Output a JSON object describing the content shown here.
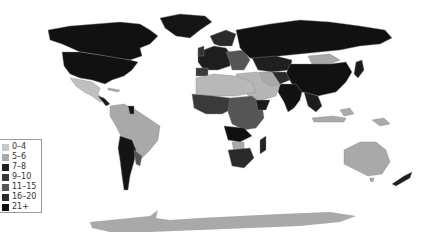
{
  "map": {
    "title": "",
    "projection": "equirectangular-world",
    "legend": {
      "items": [
        {
          "label": "0–4",
          "color": "#c8c8c8"
        },
        {
          "label": "5–6",
          "color": "#a9a9a9"
        },
        {
          "label": "7–8",
          "color": "#1e1e1e"
        },
        {
          "label": "9–10",
          "color": "#3a3a3a"
        },
        {
          "label": "11–15",
          "color": "#555555"
        },
        {
          "label": "16–20",
          "color": "#2a2a2a"
        },
        {
          "label": "21+",
          "color": "#0d0d0d"
        }
      ]
    },
    "colors": {
      "ocean": "#ffffff",
      "border": "#8a8a8a"
    }
  }
}
